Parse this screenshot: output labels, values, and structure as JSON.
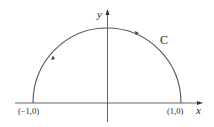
{
  "diagram": {
    "axes": {
      "x_label": "x",
      "y_label": "y"
    },
    "curve": {
      "label": "C",
      "type": "semicircle",
      "orientation": "counterclockwise",
      "color": "#555555"
    },
    "points": [
      {
        "label": "(−1,0)"
      },
      {
        "label": "(1,0)"
      }
    ],
    "colors": {
      "axis": "#444444",
      "curve": "#555555",
      "text": "#2a2a2a",
      "background": "#ffffff"
    }
  }
}
